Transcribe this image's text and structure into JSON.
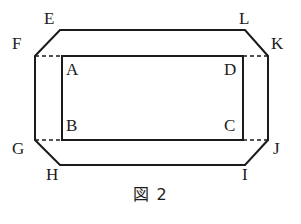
{
  "figure": {
    "caption": "図 2",
    "type": "geometric-diagram",
    "stroke_color": "#1b1b1b",
    "background_color": "#ffffff",
    "outer_polygon": {
      "name": "outer-octagon",
      "points": "60,30 245,30 268,56 268,140 245,165 60,165 35,140 35,56",
      "vertices": [
        {
          "label": "E",
          "x": 60,
          "y": 30
        },
        {
          "label": "L",
          "x": 245,
          "y": 30
        },
        {
          "label": "K",
          "x": 268,
          "y": 56
        },
        {
          "label": "J",
          "x": 268,
          "y": 140
        },
        {
          "label": "I",
          "x": 245,
          "y": 165
        },
        {
          "label": "H",
          "x": 60,
          "y": 165
        },
        {
          "label": "G",
          "x": 35,
          "y": 140
        },
        {
          "label": "F",
          "x": 35,
          "y": 56
        }
      ]
    },
    "inner_rectangle": {
      "name": "inner-rectangle",
      "points": "62,56 243,56 243,140 62,140",
      "vertices": [
        {
          "label": "A",
          "x": 62,
          "y": 56
        },
        {
          "label": "D",
          "x": 243,
          "y": 56
        },
        {
          "label": "C",
          "x": 243,
          "y": 140
        },
        {
          "label": "B",
          "x": 62,
          "y": 140
        }
      ]
    },
    "dashed_lines": [
      {
        "name": "dashed-f-to-a",
        "x1": 35,
        "y1": 56,
        "x2": 62,
        "y2": 56
      },
      {
        "name": "dashed-d-to-k",
        "x1": 243,
        "y1": 56,
        "x2": 268,
        "y2": 56
      },
      {
        "name": "dashed-g-to-b",
        "x1": 35,
        "y1": 140,
        "x2": 62,
        "y2": 140
      },
      {
        "name": "dashed-c-to-j",
        "x1": 243,
        "y1": 140,
        "x2": 268,
        "y2": 140
      }
    ],
    "labels": [
      {
        "key": "E",
        "text": "E",
        "x": 44,
        "y": 10
      },
      {
        "key": "L",
        "text": "L",
        "x": 239,
        "y": 10
      },
      {
        "key": "F",
        "text": "F",
        "x": 12,
        "y": 35
      },
      {
        "key": "K",
        "text": "K",
        "x": 271,
        "y": 35
      },
      {
        "key": "A",
        "text": "A",
        "x": 66,
        "y": 61
      },
      {
        "key": "D",
        "text": "D",
        "x": 224,
        "y": 61
      },
      {
        "key": "B",
        "text": "B",
        "x": 66,
        "y": 117
      },
      {
        "key": "C",
        "text": "C",
        "x": 224,
        "y": 117
      },
      {
        "key": "G",
        "text": "G",
        "x": 12,
        "y": 140
      },
      {
        "key": "J",
        "text": "J",
        "x": 273,
        "y": 140
      },
      {
        "key": "H",
        "text": "H",
        "x": 46,
        "y": 166
      },
      {
        "key": "I",
        "text": "I",
        "x": 242,
        "y": 166
      }
    ]
  }
}
